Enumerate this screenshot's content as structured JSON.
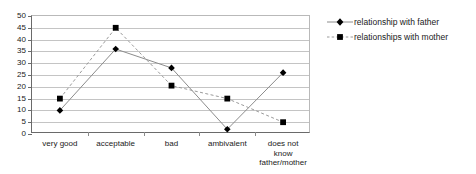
{
  "chart_data": {
    "type": "line",
    "title": "",
    "xlabel": "",
    "ylabel": "",
    "ylim": [
      0,
      50
    ],
    "ytick_step": 5,
    "grid": true,
    "legend_position": "right",
    "categories": [
      "very good",
      "acceptable",
      "bad",
      "ambivalent",
      "does not know\nfather/mother"
    ],
    "ytick_labels": [
      "50",
      "45",
      "40",
      "35",
      "30",
      "25",
      "20",
      "15",
      "10",
      "5",
      "0"
    ],
    "ytick_values": [
      50,
      45,
      40,
      35,
      30,
      25,
      20,
      15,
      10,
      5,
      0
    ],
    "series": [
      {
        "name": "relationship with father",
        "values": [
          10,
          36,
          28,
          2,
          26
        ],
        "marker": "diamond",
        "line_style": "solid",
        "color": "#8c8c8c",
        "marker_color": "#000000"
      },
      {
        "name": "relationships with mother",
        "values": [
          15,
          45,
          20.5,
          15,
          5
        ],
        "marker": "square",
        "line_style": "dashed",
        "color": "#9a9a9a",
        "marker_color": "#000000"
      }
    ]
  },
  "legend": {
    "items": [
      {
        "label": "relationship with father"
      },
      {
        "label": "relationships with mother"
      }
    ]
  },
  "colors": {
    "background": "#ffffff",
    "grid": "#c4c4c4",
    "axis": "#6a6a6a",
    "text": "#1a1a1a"
  }
}
